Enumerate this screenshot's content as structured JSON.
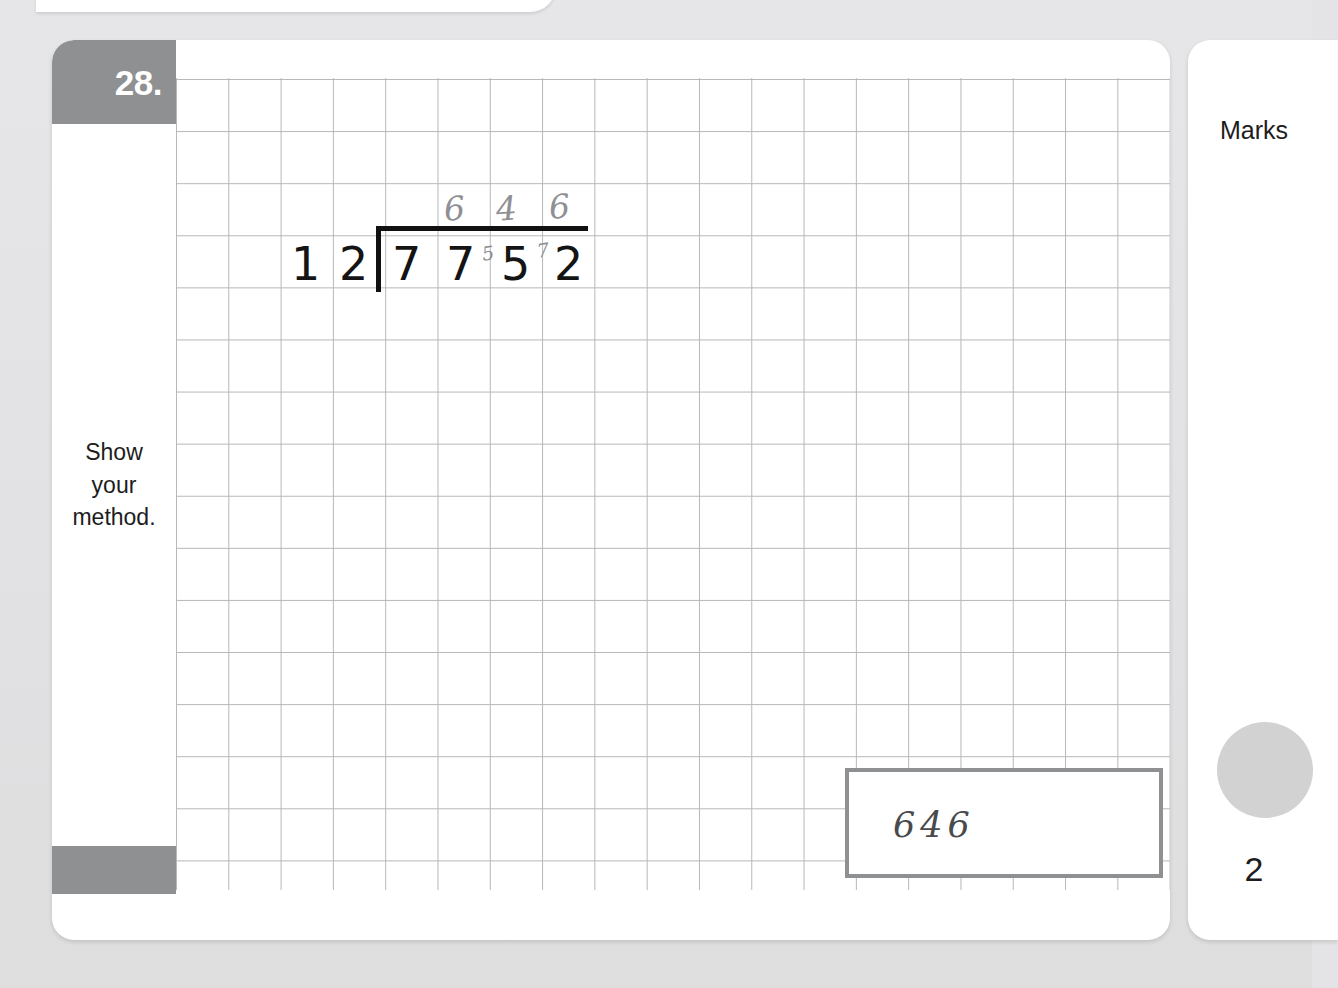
{
  "page": {
    "background_color": "#e4e4e6",
    "card_color": "#ffffff",
    "accent_grey": "#8f9092",
    "grid_line_color": "#a9abad"
  },
  "question": {
    "number_label": "28.",
    "instruction": "Show\nyour\nmethod.",
    "grid": {
      "columns": 19,
      "rows": 16,
      "cell_size_px": 52
    }
  },
  "working": {
    "type": "long-division",
    "divisor": "12",
    "dividend": "7752",
    "quotient": "646",
    "divisor_digits": [
      "1",
      "2"
    ],
    "dividend_digits": [
      "7",
      "7",
      "5",
      "2"
    ],
    "quotient_digits": [
      "6",
      "4",
      "6"
    ],
    "carry_digits": [
      "5",
      "7"
    ]
  },
  "answer_box": {
    "value": "646"
  },
  "marks": {
    "title": "Marks",
    "value": "2",
    "bubble_color": "#d2d2d3"
  }
}
